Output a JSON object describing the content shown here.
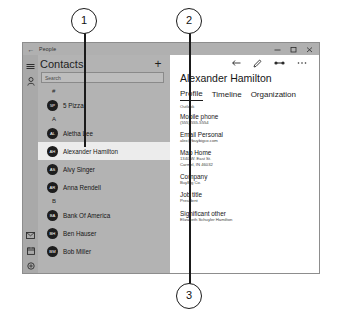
{
  "callouts": [
    {
      "number": "1"
    },
    {
      "number": "2"
    },
    {
      "number": "3"
    }
  ],
  "window": {
    "title": "People",
    "back_icon": "back-arrow-icon",
    "controls": {
      "minimize": "minimize-icon",
      "maximize": "maximize-icon",
      "close": "close-icon"
    }
  },
  "rail": {
    "menu_icon": "hamburger-menu-icon",
    "people_icon": "people-icon",
    "mail_icon": "mail-icon",
    "calendar_icon": "calendar-icon",
    "settings_icon": "settings-icon"
  },
  "list": {
    "title": "Contacts",
    "add_label": "+",
    "add_icon": "add-contact-icon",
    "search_placeholder": "Search",
    "search_value": "",
    "groups": [
      {
        "letter": "#",
        "contacts": [
          {
            "initials": "5P",
            "name": "5 Pizza"
          }
        ]
      },
      {
        "letter": "A",
        "contacts": [
          {
            "initials": "AL",
            "name": "Aletha Lee"
          },
          {
            "initials": "AH",
            "name": "Alexander Hamilton",
            "selected": true
          },
          {
            "initials": "AS",
            "name": "Alvy Singer"
          },
          {
            "initials": "AR",
            "name": "Anna Rendell"
          }
        ]
      },
      {
        "letter": "B",
        "contacts": [
          {
            "initials": "BA",
            "name": "Bank Of America"
          },
          {
            "initials": "BH",
            "name": "Ben Hauser"
          },
          {
            "initials": "BM",
            "name": "Bob Miller"
          }
        ]
      }
    ]
  },
  "detail": {
    "toolbar": {
      "pin_icon": "pin-icon",
      "edit_icon": "pencil-edit-icon",
      "share_icon": "share-link-icon",
      "more_icon": "more-options-icon"
    },
    "name": "Alexander Hamilton",
    "tabs": [
      {
        "label": "Profile",
        "active": true
      },
      {
        "label": "Timeline",
        "active": false
      },
      {
        "label": "Organization",
        "active": false
      }
    ],
    "source": "Outlook",
    "fields": [
      {
        "label": "Mobile phone",
        "value": "(555) 555-5554"
      },
      {
        "label": "Email Personal",
        "value": "alex@buybigco.com"
      },
      {
        "label": "Map Home",
        "value": "1340 W. East St.\nCarmel, IN 46032"
      },
      {
        "label": "Company",
        "value": "BuyBig Co."
      },
      {
        "label": "Job title",
        "value": "President"
      },
      {
        "label": "Significant other",
        "value": "Elizabeth Schuyler Hamilton"
      }
    ]
  }
}
